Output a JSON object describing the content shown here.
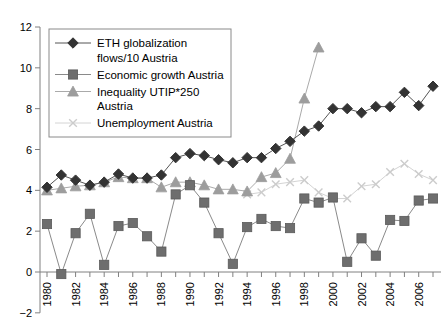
{
  "chart_data": {
    "type": "line",
    "title": "",
    "xlabel": "",
    "ylabel": "",
    "xlim": [
      1979.5,
      2007.5
    ],
    "ylim": [
      -2,
      12
    ],
    "yticks": [
      -2,
      0,
      2,
      4,
      6,
      8,
      10,
      12
    ],
    "xticks": [
      1980,
      1982,
      1984,
      1986,
      1988,
      1990,
      1992,
      1994,
      1996,
      1998,
      2000,
      2002,
      2004,
      2006
    ],
    "xtick_labels": [
      "1980",
      "1982",
      "1984",
      "1986",
      "1988",
      "1990",
      "1992",
      "1994",
      "1996",
      "1998",
      "2000",
      "2002",
      "2004",
      "2006"
    ],
    "ytick_labels": [
      "12",
      "10",
      "8",
      "6",
      "4",
      "2",
      "0",
      "-2"
    ],
    "grid": false,
    "legend_position": "upper-left",
    "x": [
      1980,
      1981,
      1982,
      1983,
      1984,
      1985,
      1986,
      1987,
      1988,
      1989,
      1990,
      1991,
      1992,
      1993,
      1994,
      1995,
      1996,
      1997,
      1998,
      1999,
      2000,
      2001,
      2002,
      2003,
      2004,
      2005,
      2006,
      2007
    ],
    "series": [
      {
        "name": "ETH globalization flows/10 Austria",
        "legend_label_lines": [
          "ETH globalization",
          "flows/10 Austria"
        ],
        "marker": "diamond",
        "color": "#333333",
        "line_color": "#555555",
        "values": [
          4.15,
          4.75,
          4.5,
          4.25,
          4.4,
          4.8,
          4.6,
          4.6,
          4.75,
          5.6,
          5.8,
          5.7,
          5.5,
          5.35,
          5.6,
          5.6,
          6.05,
          6.4,
          6.9,
          7.15,
          8.0,
          8.0,
          7.8,
          8.1,
          8.1,
          8.8,
          8.15,
          9.1
        ]
      },
      {
        "name": "Economic growth Austria",
        "legend_label_lines": [
          "Economic growth Austria"
        ],
        "marker": "square",
        "color": "#6e6e6e",
        "line_color": "#8a8a8a",
        "values": [
          2.35,
          -0.1,
          1.9,
          2.85,
          0.35,
          2.25,
          2.4,
          1.75,
          1.0,
          3.8,
          4.25,
          3.4,
          1.9,
          0.4,
          2.2,
          2.6,
          2.25,
          2.15,
          3.6,
          3.4,
          3.65,
          0.5,
          1.65,
          0.8,
          2.55,
          2.5,
          3.5,
          3.6
        ]
      },
      {
        "name": "Inequality UTIP*250 Austria",
        "legend_label_lines": [
          "Inequality UTIP*250",
          "Austria"
        ],
        "marker": "triangle",
        "color": "#9d9d9d",
        "line_color": "#aaaaaa",
        "values": [
          4.0,
          4.1,
          4.2,
          4.25,
          4.4,
          4.65,
          4.6,
          4.6,
          4.15,
          4.4,
          4.4,
          4.25,
          4.05,
          4.05,
          3.95,
          4.65,
          4.85,
          5.55,
          8.5,
          11.0,
          null,
          null,
          null,
          null,
          null,
          null,
          null,
          null
        ]
      },
      {
        "name": "Unemployment Austria",
        "legend_label_lines": [
          "Unemployment Austria"
        ],
        "marker": "x",
        "color": "#cccccc",
        "line_color": "#d4d4d4",
        "values": [
          null,
          null,
          null,
          null,
          null,
          null,
          null,
          null,
          null,
          null,
          null,
          null,
          null,
          null,
          3.8,
          3.9,
          4.3,
          4.4,
          4.5,
          3.9,
          3.6,
          3.6,
          4.2,
          4.3,
          4.9,
          5.3,
          4.8,
          4.5
        ]
      }
    ]
  }
}
